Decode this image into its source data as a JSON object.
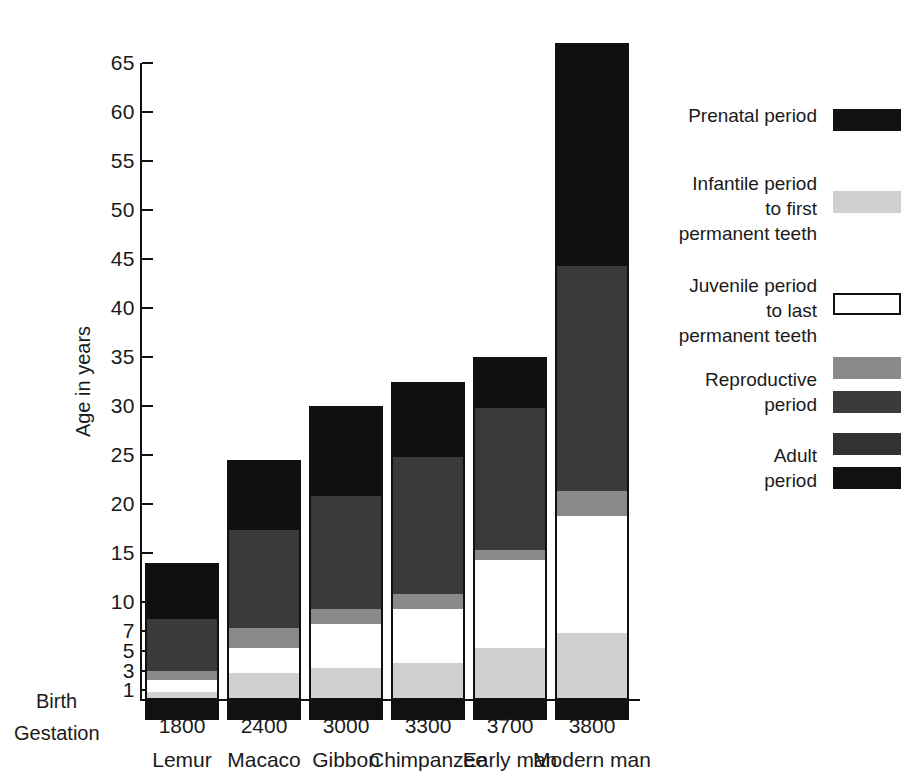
{
  "chart_data": {
    "type": "bar",
    "subtype": "stacked-bar",
    "title": "",
    "xlabel": "",
    "ylabel": "Age in years",
    "ylim": [
      0,
      68
    ],
    "yticks": [
      65,
      60,
      55,
      50,
      45,
      40,
      35,
      30,
      25,
      20,
      15,
      10,
      7,
      5,
      3,
      1
    ],
    "ytick_labels": [
      "65",
      "60",
      "55",
      "50",
      "45",
      "40",
      "35",
      "30",
      "25",
      "20",
      "15",
      "10",
      "7",
      "5",
      "3",
      "1"
    ],
    "grid": false,
    "legend_position": "right",
    "baseline_label": "Birth",
    "gestation_row_label": "Gestation",
    "categories": [
      "Lemur",
      "Macaco",
      "Gibbon",
      "Chimpanzee",
      "Early man",
      "Modern man"
    ],
    "gestation": [
      "1800",
      "2400",
      "3000",
      "3300",
      "3700",
      "3800"
    ],
    "segment_order": [
      "infantile",
      "juvenile",
      "reproductive_early",
      "reproductive_late",
      "adult"
    ],
    "series": [
      {
        "name": "Prenatal period",
        "key": "prenatal",
        "color": "#111111",
        "note": "drawn below the birth baseline",
        "values": [
          1.9,
          1.9,
          1.9,
          1.9,
          1.9,
          1.9
        ]
      },
      {
        "name": "Infantile period to first permanent teeth",
        "key": "infantile",
        "color": "#d0d0d0",
        "values": [
          1.0,
          3.0,
          3.5,
          4.0,
          5.5,
          7.0
        ]
      },
      {
        "name": "Juvenile period to last permanent teeth",
        "key": "juvenile",
        "color": "#ffffff",
        "values": [
          1.2,
          2.5,
          4.5,
          5.5,
          9.0,
          12.0
        ]
      },
      {
        "name": "Reproductive period (early)",
        "key": "reproductive_early",
        "color": "#8a8a8a",
        "values": [
          1.0,
          2.0,
          1.5,
          1.5,
          1.0,
          2.5
        ]
      },
      {
        "name": "Reproductive period (late)",
        "key": "reproductive_late",
        "color": "#3a3a3a",
        "values": [
          5.3,
          10.0,
          11.5,
          14.0,
          14.5,
          23.0
        ]
      },
      {
        "name": "Adult period",
        "key": "adult",
        "color": "#0f0f0f",
        "values": [
          5.5,
          7.0,
          9.0,
          7.5,
          5.0,
          22.5
        ]
      }
    ],
    "totals_above_birth": [
      14.0,
      24.5,
      30.0,
      32.5,
      35.0,
      67.0
    ]
  },
  "axis": {
    "ylabel": "Age in years",
    "birth": "Birth",
    "gestation": "Gestation",
    "ticks": [
      {
        "label": "65",
        "value": 65
      },
      {
        "label": "60",
        "value": 60
      },
      {
        "label": "55",
        "value": 55
      },
      {
        "label": "50",
        "value": 50
      },
      {
        "label": "45",
        "value": 45
      },
      {
        "label": "40",
        "value": 40
      },
      {
        "label": "35",
        "value": 35
      },
      {
        "label": "30",
        "value": 30
      },
      {
        "label": "25",
        "value": 25
      },
      {
        "label": "20",
        "value": 20
      },
      {
        "label": "15",
        "value": 15
      },
      {
        "label": "10",
        "value": 10
      },
      {
        "label": "7",
        "value": 7
      },
      {
        "label": "5",
        "value": 5
      },
      {
        "label": "3",
        "value": 3
      },
      {
        "label": "1",
        "value": 1
      }
    ]
  },
  "legend": {
    "items": [
      {
        "label": "Prenatal period",
        "swatches": [
          "#111111"
        ],
        "outlined": false
      },
      {
        "label": "Infantile period\nto first\npermanent teeth",
        "swatches": [
          "#d0d0d0"
        ],
        "outlined": false
      },
      {
        "label": "Juvenile period\nto last\npermanent teeth",
        "swatches": [
          "#ffffff"
        ],
        "outlined": true
      },
      {
        "label": "Reproductive\nperiod",
        "swatches": [
          "#8a8a8a",
          "#3a3a3a"
        ],
        "outlined": false
      },
      {
        "label": "Adult\nperiod",
        "swatches": [
          "#333333",
          "#111111"
        ],
        "outlined": false
      }
    ]
  },
  "colors": {
    "prenatal": "#111111",
    "infantile": "#d0d0d0",
    "juvenile": "#ffffff",
    "reproductive_early": "#8a8a8a",
    "reproductive_late": "#3a3a3a",
    "adult": "#0f0f0f",
    "axis": "#111111",
    "background": "#ffffff"
  }
}
